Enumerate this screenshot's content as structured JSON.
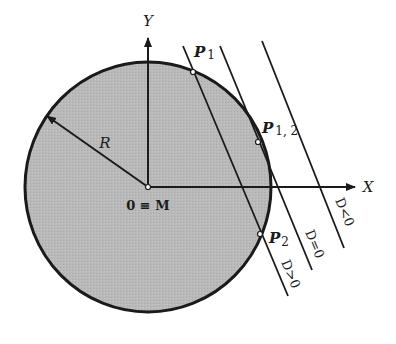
{
  "diagram": {
    "type": "geometry",
    "colors": {
      "circle_fill": "#b8b8b8",
      "stroke": "#1a1a1a",
      "background": "#ffffff"
    },
    "axes": {
      "x_label": "X",
      "y_label": "Y"
    },
    "center_label": "0 ≡ M",
    "radius_label": "R",
    "points": {
      "p1": {
        "label": "P",
        "sub": "1"
      },
      "p12": {
        "label": "P",
        "sub": "1, 2"
      },
      "p2": {
        "label": "P",
        "sub": "2"
      }
    },
    "lines": [
      {
        "id": "secant",
        "label": "D>0"
      },
      {
        "id": "tangent",
        "label": "D=0"
      },
      {
        "id": "external",
        "label": "D<0"
      }
    ]
  }
}
